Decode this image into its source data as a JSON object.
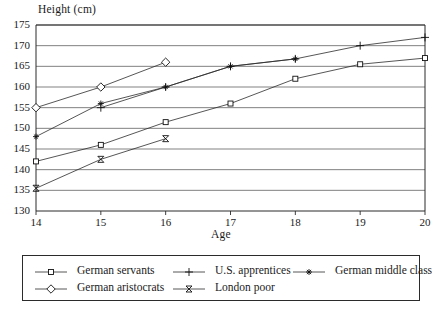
{
  "chart_data": {
    "type": "line",
    "title": "",
    "xlabel": "Age",
    "ylabel": "Height (cm)",
    "x": [
      14,
      15,
      16,
      17,
      18,
      19,
      20
    ],
    "xlim": [
      14,
      20
    ],
    "ylim": [
      130,
      175
    ],
    "yticks": [
      130,
      135,
      140,
      145,
      150,
      155,
      160,
      165,
      170,
      175
    ],
    "xticks": [
      14,
      15,
      16,
      17,
      18,
      19,
      20
    ],
    "grid": true,
    "legend_position": "bottom",
    "series": [
      {
        "name": "German servants",
        "marker": "square",
        "x": [
          14,
          15,
          16,
          17,
          18,
          19,
          20
        ],
        "values": [
          142,
          146,
          151.5,
          156,
          162,
          165.5,
          167
        ]
      },
      {
        "name": "U.S. apprentices",
        "marker": "plus",
        "x": [
          15,
          16,
          17,
          18,
          19,
          20
        ],
        "values": [
          155,
          160,
          165,
          166.8,
          170,
          172
        ]
      },
      {
        "name": "German middle class",
        "marker": "asterisk",
        "x": [
          14,
          15,
          16,
          17,
          18
        ],
        "values": [
          148,
          156,
          160,
          165,
          166.8
        ]
      },
      {
        "name": "German aristocrats",
        "marker": "diamond",
        "x": [
          14,
          15,
          16
        ],
        "values": [
          155,
          160,
          166
        ]
      },
      {
        "name": "London poor",
        "marker": "hourglass",
        "x": [
          14,
          15,
          16
        ],
        "values": [
          135.5,
          142.5,
          147.5
        ]
      }
    ]
  },
  "axes": {
    "y_title": "Height (cm)",
    "x_title": "Age",
    "y_tick_labels": [
      "175",
      "170",
      "165",
      "160",
      "155",
      "150",
      "145",
      "140",
      "135",
      "130"
    ],
    "x_tick_labels": [
      "14",
      "15",
      "16",
      "17",
      "18",
      "19",
      "20"
    ]
  },
  "legend": {
    "entries": [
      {
        "label": "German servants",
        "marker": "square"
      },
      {
        "label": "U.S. apprentices",
        "marker": "plus"
      },
      {
        "label": "German middle class",
        "marker": "asterisk"
      },
      {
        "label": "German aristocrats",
        "marker": "diamond"
      },
      {
        "label": "London poor",
        "marker": "hourglass"
      }
    ]
  },
  "colors": {
    "ink": "#1a1a1a",
    "grid": "#4a4a4a",
    "background": "#ffffff"
  }
}
